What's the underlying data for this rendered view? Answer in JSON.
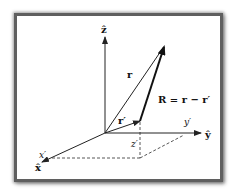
{
  "diagram": {
    "colors": {
      "frame": "#5f5f5f",
      "line": "#222222",
      "dashed": "#444444",
      "background": "#ffffff"
    },
    "axes": {
      "z": {
        "label": "ẑ"
      },
      "y": {
        "label": "ŷ"
      },
      "x": {
        "label": "x̂"
      }
    },
    "vectors": {
      "r": {
        "label": "r"
      },
      "r_prime": {
        "label": "r′"
      },
      "R": {
        "label": "R = r − r′"
      }
    },
    "components": {
      "x_prime": "x′",
      "y_prime": "y′",
      "z_prime": "z′"
    }
  }
}
